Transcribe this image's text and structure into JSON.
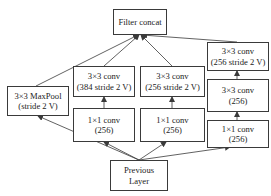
{
  "diagram": {
    "nodes": {
      "concat": {
        "label1": "Filter concat"
      },
      "maxpool": {
        "label1": "3×3 MaxPool",
        "label2": "(stride 2 V)"
      },
      "b2_conv3": {
        "label1": "3×3 conv",
        "label2": "(384 stride 2 V)"
      },
      "b2_conv1": {
        "label1": "1×1 conv",
        "label2": "(256)"
      },
      "b3_conv3": {
        "label1": "3×3 conv",
        "label2": "(256 stride 2 V)"
      },
      "b3_conv1": {
        "label1": "1×1 conv",
        "label2": "(256)"
      },
      "b4_conv3s": {
        "label1": "3×3 conv",
        "label2": "(256 stride 2 V)"
      },
      "b4_conv3": {
        "label1": "3×3 conv",
        "label2": "(256)"
      },
      "b4_conv1": {
        "label1": "1×1 conv",
        "label2": "(256)"
      },
      "prev": {
        "label1": "Previous",
        "label2": "Layer"
      }
    },
    "edges": [
      [
        "prev",
        "maxpool"
      ],
      [
        "prev",
        "b2_conv1"
      ],
      [
        "prev",
        "b3_conv1"
      ],
      [
        "prev",
        "b4_conv1"
      ],
      [
        "b2_conv1",
        "b2_conv3"
      ],
      [
        "b3_conv1",
        "b3_conv3"
      ],
      [
        "b4_conv1",
        "b4_conv3"
      ],
      [
        "b4_conv3",
        "b4_conv3s"
      ],
      [
        "maxpool",
        "concat"
      ],
      [
        "b2_conv3",
        "concat"
      ],
      [
        "b3_conv3",
        "concat"
      ],
      [
        "b4_conv3s",
        "concat"
      ]
    ],
    "colors": {
      "line": "#3a3a3a",
      "background": "#ffffff"
    }
  }
}
